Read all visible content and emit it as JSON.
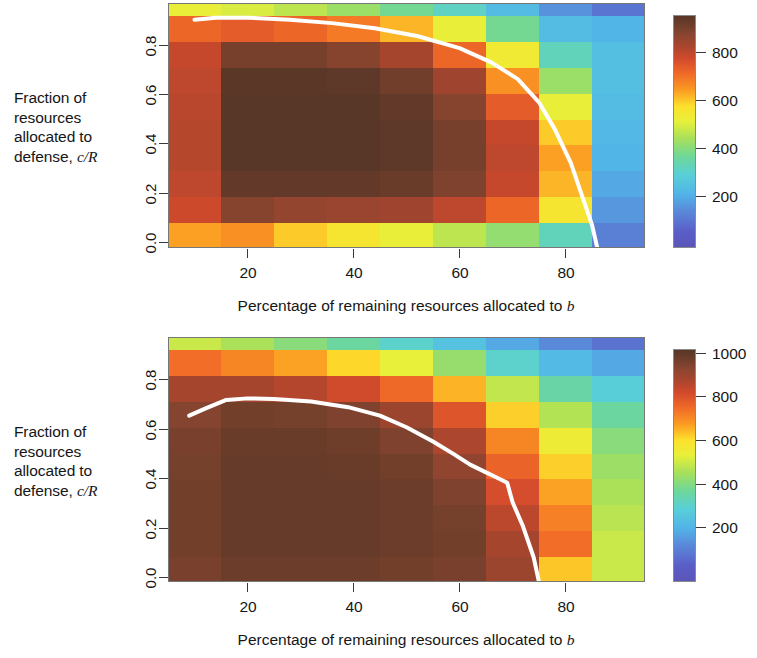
{
  "figure": {
    "width": 757,
    "height": 658,
    "background": "#ffffff"
  },
  "chart_data": [
    {
      "type": "heatmap",
      "id": "panel-top",
      "title": "",
      "xlabel": "Percentage of remaining resources allocated to b",
      "ylabel": "Fraction of resources allocated to defense, c/R",
      "xlim": [
        5,
        95
      ],
      "ylim": [
        0.0,
        0.95
      ],
      "xticks": [
        20,
        40,
        60,
        80
      ],
      "yticks": [
        "0.0",
        "0.2",
        "0.4",
        "0.6",
        "0.8"
      ],
      "grid": false,
      "colorbar": {
        "ticks": [
          200,
          400,
          600,
          800
        ],
        "vmin": 0,
        "vmax": 950,
        "colormap": "jet-brown",
        "position": "right"
      },
      "x_centers": [
        7.5,
        17.5,
        27.5,
        37.5,
        47.5,
        57.5,
        67.5,
        77.5,
        87.5
      ],
      "y_centers": [
        0.05,
        0.15,
        0.25,
        0.35,
        0.45,
        0.55,
        0.65,
        0.75,
        0.85,
        0.93
      ],
      "values": [
        [
          640,
          660,
          600,
          560,
          520,
          470,
          420,
          330,
          130
        ],
        [
          780,
          880,
          860,
          850,
          840,
          800,
          720,
          560,
          170
        ],
        [
          800,
          930,
          930,
          930,
          920,
          890,
          790,
          620,
          200
        ],
        [
          810,
          950,
          950,
          950,
          940,
          900,
          800,
          640,
          220
        ],
        [
          810,
          950,
          950,
          950,
          940,
          900,
          790,
          600,
          230
        ],
        [
          805,
          950,
          950,
          950,
          930,
          880,
          740,
          520,
          240
        ],
        [
          800,
          945,
          945,
          940,
          910,
          840,
          660,
          430,
          250
        ],
        [
          790,
          900,
          900,
          880,
          830,
          720,
          540,
          330,
          250
        ],
        [
          720,
          740,
          720,
          690,
          620,
          520,
          380,
          240,
          220
        ],
        [
          520,
          500,
          470,
          430,
          380,
          320,
          240,
          160,
          110
        ]
      ],
      "overlay_curve": {
        "label": "optimal allocation",
        "color": "#ffffff",
        "x": [
          10,
          14,
          20,
          28,
          36,
          44,
          52,
          60,
          66,
          71,
          75,
          78,
          81,
          83,
          85,
          86
        ],
        "y": [
          0.885,
          0.893,
          0.893,
          0.885,
          0.872,
          0.852,
          0.822,
          0.775,
          0.72,
          0.655,
          0.565,
          0.46,
          0.33,
          0.21,
          0.09,
          0.0
        ]
      }
    },
    {
      "type": "heatmap",
      "id": "panel-bottom",
      "title": "",
      "xlabel": "Percentage of remaining resources allocated to b",
      "ylabel": "Fraction of resources allocated to defense, c/R",
      "xlim": [
        5,
        95
      ],
      "ylim": [
        0.0,
        0.95
      ],
      "xticks": [
        20,
        40,
        60,
        80
      ],
      "yticks": [
        "0.0",
        "0.2",
        "0.4",
        "0.6",
        "0.8"
      ],
      "grid": false,
      "colorbar": {
        "ticks": [
          200,
          400,
          600,
          800,
          1000
        ],
        "vmin": 0,
        "vmax": 1100,
        "colormap": "jet-brown",
        "position": "right"
      },
      "x_centers": [
        7.5,
        17.5,
        27.5,
        37.5,
        47.5,
        57.5,
        67.5,
        77.5,
        87.5
      ],
      "y_centers": [
        0.05,
        0.15,
        0.25,
        0.35,
        0.45,
        0.55,
        0.65,
        0.75,
        0.85,
        0.93
      ],
      "values": [
        [
          1040,
          1060,
          1060,
          1060,
          1050,
          1040,
          980,
          700,
          560
        ],
        [
          1050,
          1070,
          1070,
          1070,
          1060,
          1050,
          960,
          820,
          560
        ],
        [
          1050,
          1070,
          1070,
          1070,
          1060,
          1045,
          930,
          790,
          540
        ],
        [
          1050,
          1070,
          1070,
          1070,
          1060,
          1030,
          890,
          740,
          520
        ],
        [
          1045,
          1070,
          1070,
          1065,
          1050,
          1000,
          840,
          690,
          500
        ],
        [
          1040,
          1065,
          1065,
          1055,
          1030,
          950,
          780,
          620,
          470
        ],
        [
          1020,
          1050,
          1045,
          1030,
          980,
          870,
          690,
          530,
          420
        ],
        [
          960,
          960,
          940,
          900,
          830,
          720,
          550,
          410,
          340
        ],
        [
          820,
          780,
          740,
          680,
          600,
          490,
          360,
          270,
          230
        ],
        [
          560,
          520,
          470,
          420,
          360,
          300,
          230,
          170,
          120
        ]
      ],
      "overlay_curve": {
        "label": "optimal allocation",
        "color": "#ffffff",
        "x": [
          9,
          12,
          16,
          20,
          25,
          32,
          39,
          45,
          50,
          55,
          59,
          62,
          65,
          67,
          69,
          70,
          72,
          74,
          75
        ],
        "y": [
          0.645,
          0.672,
          0.706,
          0.712,
          0.71,
          0.7,
          0.678,
          0.645,
          0.6,
          0.545,
          0.495,
          0.455,
          0.425,
          0.405,
          0.385,
          0.31,
          0.215,
          0.095,
          0.0
        ]
      }
    }
  ],
  "panels": [
    {
      "name": "top",
      "ylabel_lines": [
        "Fraction of",
        "resources",
        "allocated to",
        "defense, "
      ],
      "ylabel_math_num": "c",
      "ylabel_math_slash": "/",
      "ylabel_math_den": "R",
      "xlabel_prefix": "Percentage of remaining resources allocated to ",
      "xlabel_math": "b",
      "xticks": [
        "20",
        "40",
        "60",
        "80"
      ],
      "yticks": [
        "0.8",
        "0.6",
        "0.4",
        "0.2",
        "0.0"
      ],
      "cbar_labels": [
        "800",
        "600",
        "400",
        "200"
      ]
    },
    {
      "name": "bottom",
      "ylabel_lines": [
        "Fraction of",
        "resources",
        "allocated to",
        "defense, "
      ],
      "ylabel_math_num": "c",
      "ylabel_math_slash": "/",
      "ylabel_math_den": "R",
      "xlabel_prefix": "Percentage of remaining resources allocated to ",
      "xlabel_math": "b",
      "xticks": [
        "20",
        "40",
        "60",
        "80"
      ],
      "yticks": [
        "0.8",
        "0.6",
        "0.4",
        "0.2",
        "0.0"
      ],
      "cbar_labels": [
        "1000",
        "800",
        "600",
        "400",
        "200"
      ]
    }
  ],
  "colors": {
    "curve": "#ffffff",
    "axis": "#3a3a3a",
    "text": "#161616",
    "cmap_stops": [
      "#4a3228",
      "#6b3d2a",
      "#8a4530",
      "#a8452e",
      "#d24a2c",
      "#f06a28",
      "#fb9a22",
      "#fde02c",
      "#e8f03a",
      "#a8e05a",
      "#6ed79a",
      "#58cfd8",
      "#52b4e8",
      "#5a86d8",
      "#5b5fc0",
      "#5b55b8"
    ]
  }
}
